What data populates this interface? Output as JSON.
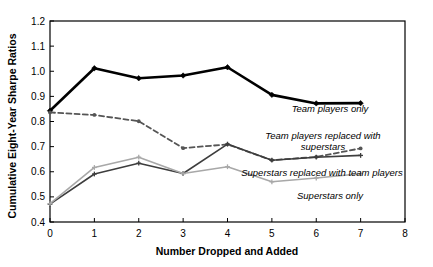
{
  "chart_data": {
    "type": "line",
    "title": "",
    "xlabel": "Number Dropped and Added",
    "ylabel": "Cumulative Eight-Year Sharpe Ratios",
    "xlim": [
      0,
      8
    ],
    "ylim": [
      0.4,
      1.2
    ],
    "xticks": [
      0,
      1,
      2,
      3,
      4,
      5,
      6,
      7,
      8
    ],
    "xtick_labels": [
      "0",
      "1",
      "2",
      "3",
      "4",
      "5",
      "6",
      "7",
      "8"
    ],
    "yticks": [
      0.4,
      0.5,
      0.6,
      0.7,
      0.8,
      0.9,
      1.0,
      1.1,
      1.2
    ],
    "ytick_labels": [
      "0.4",
      "0.5",
      "0.6",
      "0.7",
      "0.8",
      "0.9",
      "1.0",
      "1.1",
      "1.2"
    ],
    "grid": false,
    "legend_position": "inline-annotations",
    "x": [
      0,
      1,
      2,
      3,
      4,
      5,
      6,
      7
    ],
    "series": [
      {
        "name": "Team players only",
        "values": [
          0.843,
          1.012,
          0.972,
          0.983,
          1.016,
          0.906,
          0.872,
          0.873
        ],
        "color": "#000000",
        "style": "solid",
        "width": 2.6,
        "marker": "diamond"
      },
      {
        "name": "Team players replaced with superstars",
        "values": [
          0.836,
          0.826,
          0.801,
          0.694,
          0.709,
          0.646,
          0.659,
          0.693
        ],
        "color": "#555555",
        "style": "dashed",
        "width": 1.8,
        "marker": "dot"
      },
      {
        "name": "Superstars replaced with team players",
        "values": [
          0.471,
          0.591,
          0.634,
          0.593,
          0.71,
          0.646,
          0.658,
          0.665
        ],
        "color": "#3d3d3d",
        "style": "solid",
        "width": 1.6,
        "marker": "plus"
      },
      {
        "name": "Superstars only",
        "values": [
          0.473,
          0.617,
          0.658,
          0.593,
          0.62,
          0.56,
          0.575,
          0.592
        ],
        "color": "#a8a8a8",
        "style": "solid",
        "width": 1.6,
        "marker": "plus"
      }
    ],
    "annotations": [
      {
        "text": "Team players only",
        "x_px": 330,
        "y_px": 112,
        "anchor": "middle",
        "lines": [
          "Team players only"
        ]
      },
      {
        "text": "Team players replaced with superstars",
        "x_px": 323,
        "y_px": 139,
        "anchor": "middle",
        "lines": [
          "Team players replaced with",
          "superstars"
        ]
      },
      {
        "text": "Superstars replaced with team players",
        "x_px": 322,
        "y_px": 176,
        "anchor": "middle",
        "lines": [
          "Superstars replaced with team players"
        ]
      },
      {
        "text": "Superstars only",
        "x_px": 330,
        "y_px": 199,
        "anchor": "middle",
        "lines": [
          "Superstars only"
        ]
      }
    ]
  },
  "colors": {
    "background": "#ffffff",
    "axis": "#000000",
    "team_players_only": "#000000",
    "team_replaced_superstars": "#555555",
    "superstars_replaced_team": "#3d3d3d",
    "superstars_only": "#a8a8a8"
  }
}
